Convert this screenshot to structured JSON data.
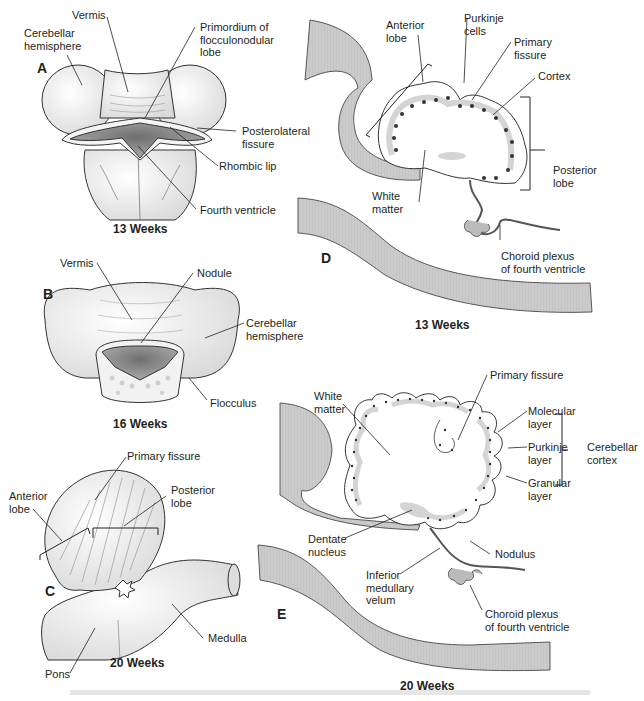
{
  "figure": {
    "colors": {
      "ink": "#231f20",
      "tissue_gray": "#c8c8c8",
      "cortex_gray": "#d4d4d4",
      "ventricle_dark": "#8a8a8a",
      "background": "#ffffff"
    },
    "panels": [
      {
        "id": "A",
        "letter": "A",
        "caption": "13 Weeks",
        "labels": [
          "Vermis",
          "Cerebellar\nhemisphere",
          "Primordium of\nflocculonodular\nlobe",
          "Posterolateral\nfissure",
          "Rhombic lip",
          "Fourth ventricle"
        ]
      },
      {
        "id": "B",
        "letter": "B",
        "caption": "16 Weeks",
        "labels": [
          "Vermis",
          "Nodule",
          "Cerebellar\nhemisphere",
          "Flocculus"
        ]
      },
      {
        "id": "C",
        "letter": "C",
        "caption": "20 Weeks",
        "labels": [
          "Primary fissure",
          "Anterior\nlobe",
          "Posterior\nlobe",
          "Medulla",
          "Pons"
        ]
      },
      {
        "id": "D",
        "letter": "D",
        "caption": "13 Weeks",
        "labels": [
          "Anterior\nlobe",
          "Purkinje\ncells",
          "Primary\nfissure",
          "Cortex",
          "Posterior\nlobe",
          "White\nmatter",
          "Choroid plexus\nof fourth ventricle"
        ]
      },
      {
        "id": "E",
        "letter": "E",
        "caption": "20 Weeks",
        "labels": [
          "White\nmatter",
          "Primary fissure",
          "Molecular\nlayer",
          "Purkinje\nlayer",
          "Granular\nlayer",
          "Cerebellar\ncortex",
          "Dentate\nnucleus",
          "Nodulus",
          "Inferior\nmedullary\nvelum",
          "Choroid plexus\nof fourth ventricle"
        ]
      }
    ]
  }
}
